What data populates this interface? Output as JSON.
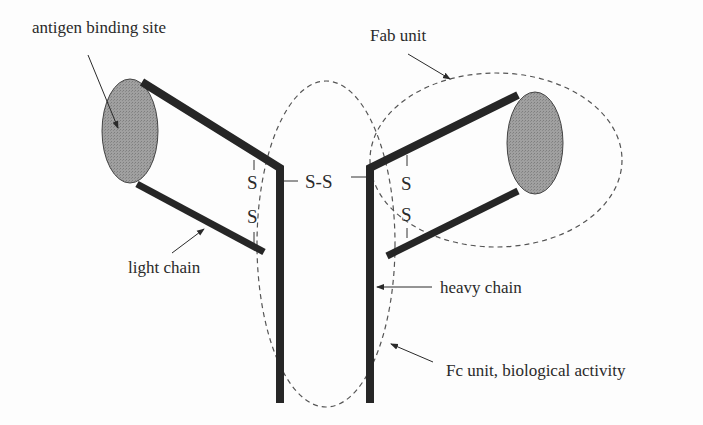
{
  "diagram": {
    "labels": {
      "antigen_binding_site": "antigen binding site",
      "fab_unit": "Fab unit",
      "light_chain": "light chain",
      "heavy_chain": "heavy chain",
      "fc_unit": "Fc unit, biological activity"
    },
    "bonds": {
      "center": "S-S",
      "left_upper": "S",
      "left_lower": "S",
      "right_upper": "S",
      "right_lower": "S"
    },
    "colors": {
      "chain": "#262626",
      "binding_site_fill": "#9a9a9a",
      "dashed_outline": "#555555",
      "text": "#2a2a2a"
    }
  }
}
